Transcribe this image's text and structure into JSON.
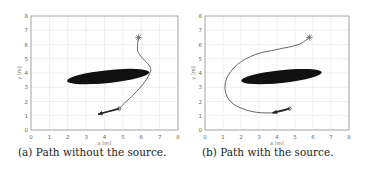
{
  "figures": [
    {
      "id": "a",
      "caption": "(a) Path without the source.",
      "chart_data": {
        "type": "line",
        "title": "",
        "xlabel": "x [m]",
        "ylabel": "y [m]",
        "xlim": [
          0,
          8
        ],
        "ylim": [
          0,
          8
        ],
        "xticks": [
          "0",
          "1",
          "2",
          "3",
          "4",
          "5",
          "6",
          "7",
          "8"
        ],
        "yticks": [
          "0",
          "1",
          "2",
          "3",
          "4",
          "5",
          "6",
          "7",
          "8"
        ],
        "grid": true,
        "obstacle": {
          "shape": "ellipse",
          "cx": 4.2,
          "cy": 3.75,
          "rx": 2.25,
          "ry": 0.45,
          "angle_deg": 6,
          "color": "#111111"
        },
        "start_marker": {
          "symbol": "star",
          "x": 5.85,
          "y": 6.5
        },
        "waypoint_marker": {
          "symbol": "diamond",
          "x": 4.8,
          "y": 1.5
        },
        "arrow_tip": {
          "x": 3.65,
          "y": 1.1
        },
        "path": [
          [
            5.85,
            6.5
          ],
          [
            5.8,
            6.0
          ],
          [
            5.82,
            5.5
          ],
          [
            6.1,
            5.0
          ],
          [
            6.45,
            4.5
          ],
          [
            6.5,
            4.1
          ],
          [
            6.2,
            3.4
          ],
          [
            5.6,
            2.5
          ],
          [
            5.1,
            1.9
          ],
          [
            4.8,
            1.5
          ]
        ]
      }
    },
    {
      "id": "b",
      "caption": "(b) Path with the source.",
      "chart_data": {
        "type": "line",
        "title": "",
        "xlabel": "x [m]",
        "ylabel": "y [m]",
        "xlim": [
          0,
          8
        ],
        "ylim": [
          0,
          8
        ],
        "xticks": [
          "0",
          "1",
          "2",
          "3",
          "4",
          "5",
          "6",
          "7",
          "8"
        ],
        "yticks": [
          "0",
          "1",
          "2",
          "3",
          "4",
          "5",
          "6",
          "7",
          "8"
        ],
        "grid": true,
        "obstacle": {
          "shape": "ellipse",
          "cx": 4.25,
          "cy": 3.75,
          "rx": 2.25,
          "ry": 0.45,
          "angle_deg": 6,
          "color": "#111111"
        },
        "start_marker": {
          "symbol": "star",
          "x": 5.8,
          "y": 6.5
        },
        "waypoint_marker": {
          "symbol": "diamond",
          "x": 4.7,
          "y": 1.5
        },
        "arrow_tip": {
          "x": 3.75,
          "y": 1.2
        },
        "path": [
          [
            5.8,
            6.5
          ],
          [
            5.2,
            6.0
          ],
          [
            4.0,
            5.65
          ],
          [
            2.8,
            5.3
          ],
          [
            1.8,
            4.6
          ],
          [
            1.2,
            3.6
          ],
          [
            1.15,
            2.6
          ],
          [
            1.6,
            1.8
          ],
          [
            2.6,
            1.3
          ],
          [
            3.6,
            1.2
          ],
          [
            4.2,
            1.3
          ],
          [
            4.7,
            1.5
          ]
        ]
      }
    }
  ]
}
